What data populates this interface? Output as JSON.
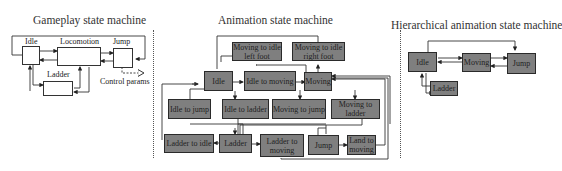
{
  "panels": {
    "gameplay": {
      "title": "Gameplay state machine",
      "states": [
        "Idle",
        "Locomotion",
        "Jump",
        "Ladder"
      ],
      "annotation": "Control params"
    },
    "animation": {
      "title": "Animation state machine",
      "states": [
        "Moving to idle left foot",
        "Moving to idle right foot",
        "Idle",
        "Idle to moving",
        "Moving",
        "Idle to jump",
        "Idle to ladder",
        "Moving to jump",
        "Moving to ladder",
        "Ladder to idle",
        "Ladder",
        "Ladder to moving",
        "Jump",
        "Land to moving"
      ]
    },
    "hierarchical": {
      "title": "Hierarchical animation state machine",
      "states": [
        "Idle",
        "Moving",
        "Jump",
        "Ladder"
      ]
    }
  },
  "colors": {
    "state_fill": "#7f7f7f",
    "gameplay_fill": "#ffffff",
    "stroke": "#333333"
  }
}
